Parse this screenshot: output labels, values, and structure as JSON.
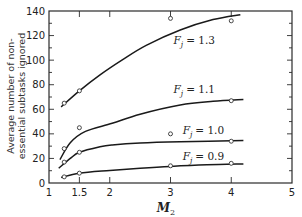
{
  "chart_data": {
    "type": "line",
    "title": "",
    "xlabel": "M2",
    "xlabel_main": "M",
    "xlabel_sub": "2",
    "ylabel_lines": [
      "Average number of non-",
      "essential subtasks ignored"
    ],
    "ylabel": "Average number of non-essential subtasks ignored",
    "xlim": [
      1,
      5
    ],
    "ylim": [
      0,
      140
    ],
    "x_ticks": [
      1,
      1.5,
      2,
      3,
      4,
      5
    ],
    "x_tick_labels": [
      "1",
      "1.5",
      "2",
      "3",
      "4",
      "5"
    ],
    "y_ticks": [
      0,
      20,
      40,
      60,
      80,
      100,
      120,
      140
    ],
    "y_tick_labels": [
      "0",
      "20",
      "40",
      "60",
      "80",
      "100",
      "120",
      "140"
    ],
    "y_minor_step": 10,
    "grid": false,
    "legend": "inline labels on curves",
    "series": [
      {
        "name": "Fj = 1.3",
        "label_prefix": "F",
        "label_sub": "j",
        "label_value": "= 1.3",
        "label_pos": [
          3.05,
          113
        ],
        "points": [
          [
            1.25,
            65
          ],
          [
            1.5,
            75
          ],
          [
            3,
            134
          ],
          [
            4,
            132
          ]
        ],
        "curve": [
          [
            1.2,
            62
          ],
          [
            1.5,
            75
          ],
          [
            1.84,
            88
          ],
          [
            2.2,
            100
          ],
          [
            2.6,
            112
          ],
          [
            3.16,
            124.5
          ],
          [
            3.7,
            133
          ],
          [
            4.15,
            137
          ]
        ]
      },
      {
        "name": "Fj = 1.1",
        "label_prefix": "F",
        "label_sub": "j",
        "label_value": "= 1.1",
        "label_pos": [
          3.05,
          73
        ],
        "points": [
          [
            1.25,
            28
          ],
          [
            1.5,
            45
          ],
          [
            4,
            67
          ]
        ],
        "curve": [
          [
            1.18,
            19
          ],
          [
            1.35,
            32.8
          ],
          [
            1.6,
            42
          ],
          [
            2.04,
            48.6
          ],
          [
            2.5,
            56
          ],
          [
            3.16,
            63.5
          ],
          [
            3.7,
            66.5
          ],
          [
            4.2,
            68
          ]
        ]
      },
      {
        "name": "Fj = 1.0",
        "label_prefix": "F",
        "label_sub": "j",
        "label_value": "= 1.0",
        "label_pos": [
          3.2,
          40
        ],
        "points": [
          [
            1.25,
            17
          ],
          [
            1.5,
            25
          ],
          [
            3,
            40
          ],
          [
            4,
            34
          ]
        ],
        "curve": [
          [
            1.16,
            12
          ],
          [
            1.35,
            20
          ],
          [
            1.5,
            25
          ],
          [
            1.84,
            29.5
          ],
          [
            2.04,
            31
          ],
          [
            2.5,
            32.6
          ],
          [
            3.16,
            33.6
          ],
          [
            4.2,
            34.5
          ]
        ]
      },
      {
        "name": "Fj = 0.9",
        "label_prefix": "F",
        "label_sub": "j",
        "label_value": "= 0.9",
        "label_pos": [
          3.2,
          19
        ],
        "points": [
          [
            1.25,
            5
          ],
          [
            1.5,
            8
          ],
          [
            3,
            14
          ],
          [
            4,
            16
          ]
        ],
        "curve": [
          [
            1.2,
            4.5
          ],
          [
            1.5,
            8
          ],
          [
            2,
            10.2
          ],
          [
            2.5,
            12
          ],
          [
            3,
            13.5
          ],
          [
            3.6,
            14.8
          ],
          [
            4.2,
            15.5
          ]
        ]
      }
    ]
  }
}
